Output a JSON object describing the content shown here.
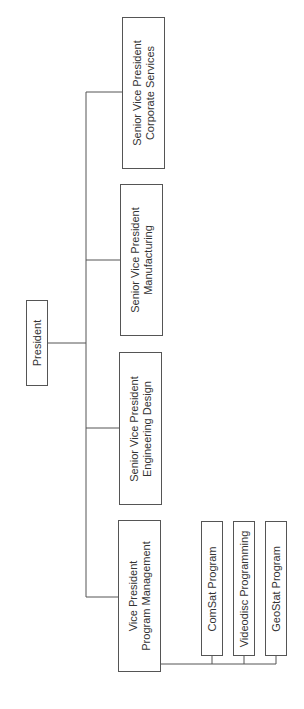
{
  "diagram": {
    "type": "org-chart",
    "orientation": "rotated-90-ccw",
    "line_color": "#555555",
    "root": {
      "title": "President"
    },
    "executives": [
      {
        "line1": "Senior Vice President",
        "line2": "Corporate Services"
      },
      {
        "line1": "Senior Vice President",
        "line2": "Manufacturing"
      },
      {
        "line1": "Senior Vice President",
        "line2": "Engineering Design"
      },
      {
        "line1": "Vice President",
        "line2": "Program Management"
      }
    ],
    "programs": [
      {
        "title": "ComSat Program"
      },
      {
        "title": "Videodisc Programming"
      },
      {
        "title": "GeoStat Program"
      }
    ]
  }
}
